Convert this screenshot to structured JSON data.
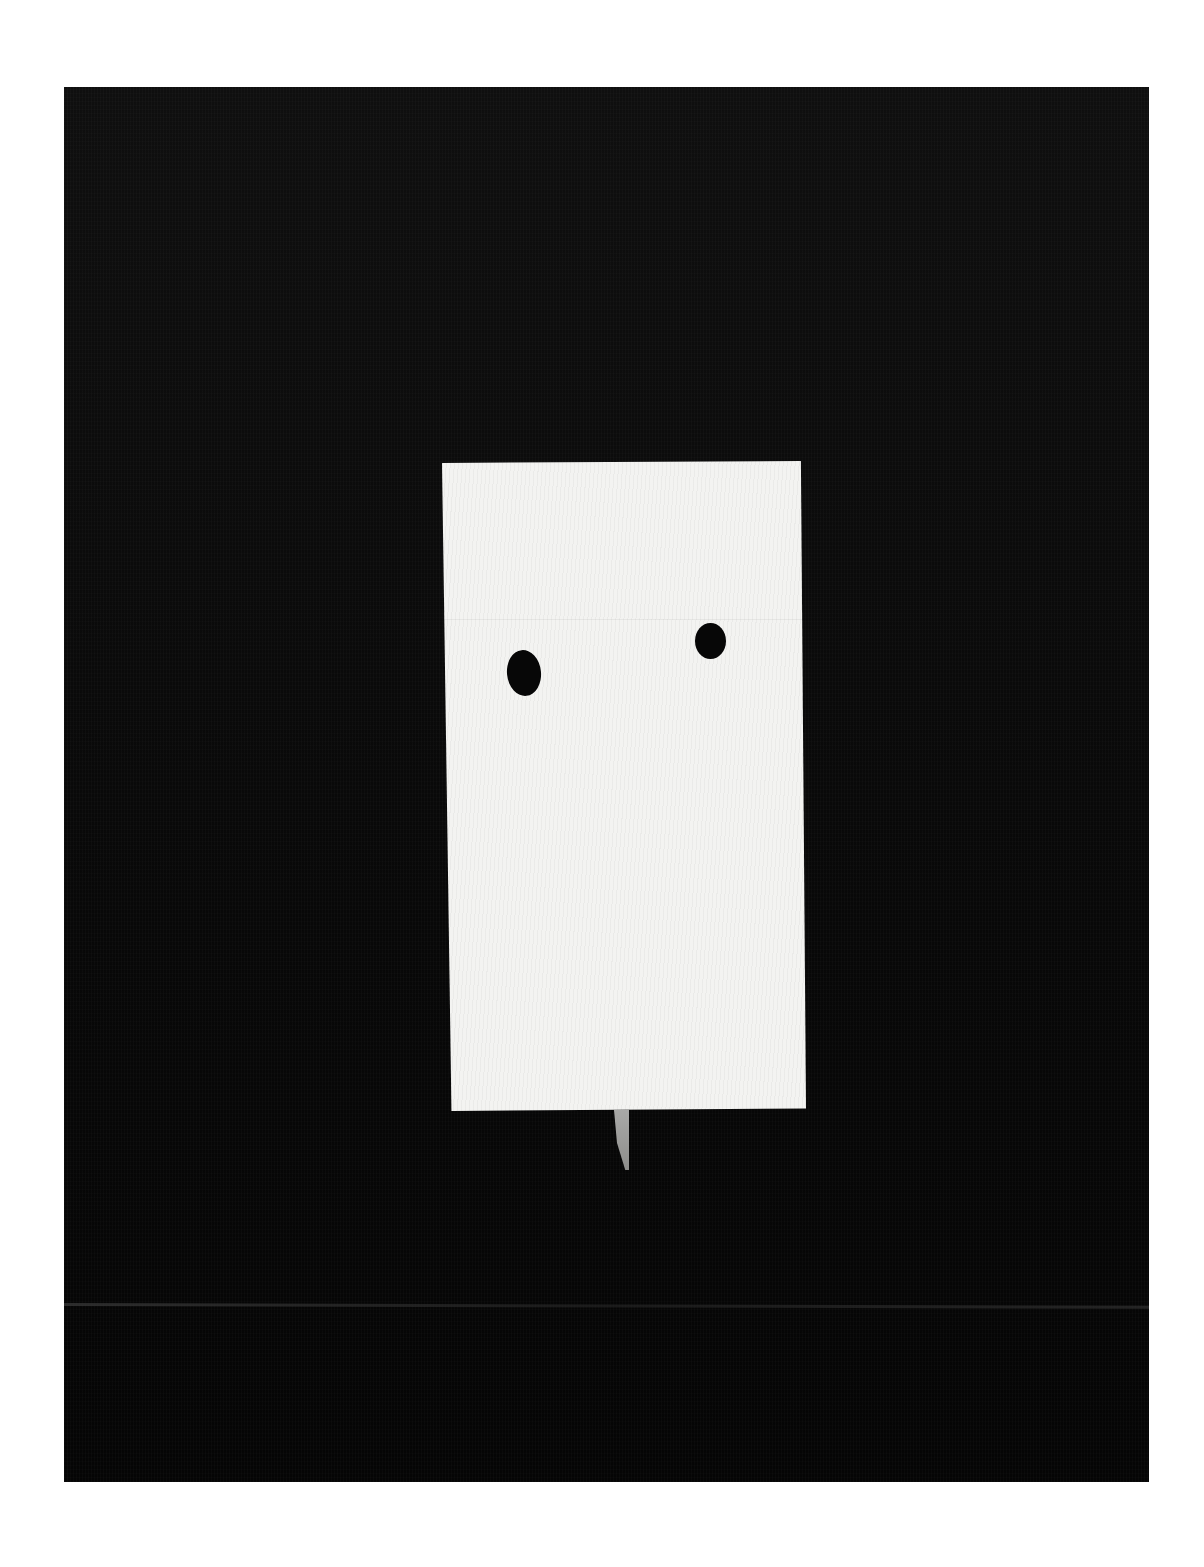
{
  "artwork": {
    "description": "Photograph of a white fabric rectangle with two black dots, mounted on a black textured background",
    "colors": {
      "background_page": "#ffffff",
      "panel": "#0a0a0a",
      "card": "#f3f3f1",
      "dots": "#070707",
      "tab": "#9c9c9a"
    }
  }
}
